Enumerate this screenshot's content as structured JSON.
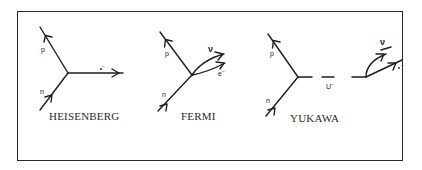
{
  "figure": {
    "frame_color": "#2a2a2a",
    "line_color": "#1e1e1e"
  },
  "diagrams": [
    {
      "title": "HEISENBERG",
      "particles": {
        "proton": "p",
        "neutron": "n",
        "electron": "e",
        "electron_charge": "−"
      }
    },
    {
      "title": "FERMI",
      "particles": {
        "proton": "p",
        "neutron": "n",
        "neutrino": "ν",
        "electron": "e",
        "electron_charge": "−"
      }
    },
    {
      "title": "YUKAWA",
      "particles": {
        "proton": "p",
        "neutron": "n",
        "mediator": "U",
        "mediator_charge": "−",
        "neutrino": "ν",
        "electron": "e",
        "electron_charge": "−"
      }
    }
  ]
}
